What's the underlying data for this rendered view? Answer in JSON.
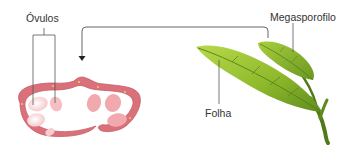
{
  "labels": {
    "ovules": "Óvulos",
    "megasporophyll": "Megasporofilo",
    "leaf": "Folha"
  },
  "colors": {
    "ovary_wall": "#d9707a",
    "ovary_wall_dark": "#c05a66",
    "ovule_fill": "#f7c9cc",
    "ovule_light": "#fbe3e4",
    "leaf_light": "#a9cc3a",
    "leaf_dark": "#5f8a1a",
    "stem": "#4f7a16",
    "leader_line": "#555555",
    "text": "#333333"
  }
}
